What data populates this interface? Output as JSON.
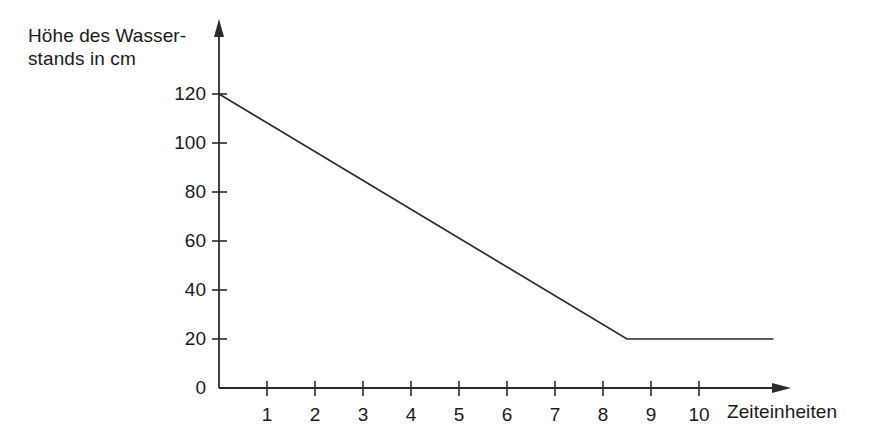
{
  "chart_data": {
    "type": "line",
    "title": "",
    "ylabel": "Höhe des Wasser-\nstands in cm",
    "ylabel_line1": "Höhe des Wasser-",
    "ylabel_line2": "stands in cm",
    "xlabel": "Zeiteinheiten",
    "xlim": [
      0,
      11.9
    ],
    "ylim": [
      0,
      131
    ],
    "grid": false,
    "legend": null,
    "x_ticks": [
      1,
      2,
      3,
      4,
      5,
      6,
      7,
      8,
      9,
      10
    ],
    "x_tick_labels": [
      "1",
      "2",
      "3",
      "4",
      "5",
      "6",
      "7",
      "8",
      "9",
      "10"
    ],
    "y_ticks": [
      0,
      20,
      40,
      60,
      80,
      100,
      120
    ],
    "y_tick_labels": [
      "0",
      "20",
      "40",
      "60",
      "80",
      "100",
      "120"
    ],
    "series": [
      {
        "name": "Wasserstand",
        "color": "#2b2b2b",
        "x": [
          0,
          8.5,
          11.55
        ],
        "y": [
          120,
          20,
          20
        ],
        "points": [
          {
            "x": 0,
            "y": 120
          },
          {
            "x": 8.5,
            "y": 20
          },
          {
            "x": 11.55,
            "y": 20
          }
        ]
      }
    ],
    "annotations": [],
    "axis_style": {
      "x_axis_arrow": true,
      "y_axis_arrow": true,
      "axis_color": "#2b2b2b",
      "line_width": 1.6
    }
  },
  "figure": {
    "background_color": "#ffffff",
    "text_color": "#1a1a1a"
  }
}
